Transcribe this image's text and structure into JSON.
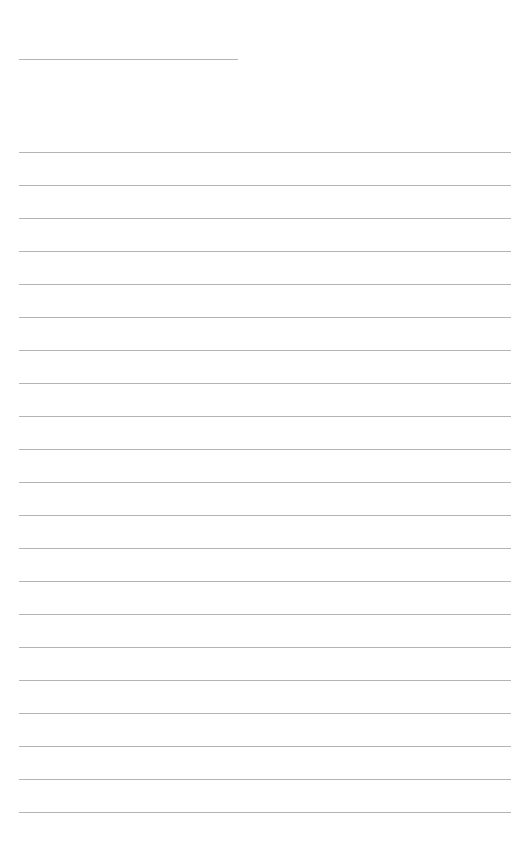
{
  "page": {
    "type": "blank-lined-page",
    "line_color": "#b4b4b4",
    "background_color": "#ffffff",
    "title_line": {
      "label": "",
      "value": ""
    },
    "ruled_lines": {
      "count": 21,
      "first_line_y": 152,
      "spacing": 33,
      "values": [
        "",
        "",
        "",
        "",
        "",
        "",
        "",
        "",
        "",
        "",
        "",
        "",
        "",
        "",
        "",
        "",
        "",
        "",
        "",
        "",
        ""
      ]
    }
  }
}
